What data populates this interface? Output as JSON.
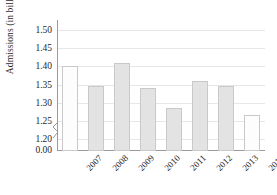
{
  "chart_data": {
    "type": "bar",
    "title": "",
    "xlabel": "",
    "ylabel": "Admissions (in billions)",
    "categories": [
      "2007",
      "2008",
      "2009",
      "2010",
      "2011",
      "2012",
      "2013",
      "2014"
    ],
    "values": [
      1.4,
      1.345,
      1.41,
      1.34,
      1.285,
      1.36,
      1.345,
      1.265
    ],
    "series": [
      {
        "name": "Admissions",
        "values": [
          1.4,
          1.345,
          1.41,
          1.34,
          1.285,
          1.36,
          1.345,
          1.265
        ]
      }
    ],
    "ytick_labels": [
      "1.50",
      "1.45",
      "1.40",
      "1.35",
      "1.30",
      "1.25",
      "1.20",
      "0.00"
    ],
    "ytick_values": [
      1.5,
      1.45,
      1.4,
      1.35,
      1.3,
      1.25,
      1.2,
      0.0
    ],
    "ylim": [
      1.175,
      1.52
    ],
    "y_axis_break": true,
    "y_axis_break_between": [
      1.2,
      0.0
    ],
    "grid": "horizontal",
    "legend": "none",
    "bar_colors": [
      "#fdfdfd",
      "#e3e3e3",
      "#e3e3e3",
      "#e3e3e3",
      "#e3e3e3",
      "#e3e3e3",
      "#e3e3e3",
      "#fdfdfd"
    ],
    "bar_edge_color": "#c9c9c9",
    "gridline_color": "#e6e6e6",
    "axis_color": "#9a9a9a",
    "text_color": "#1f1f1f",
    "background": "#ffffff",
    "xtick_rotation": -45
  }
}
